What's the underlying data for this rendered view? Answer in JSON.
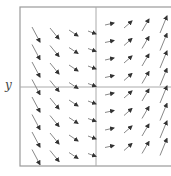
{
  "chart_data": {
    "type": "quiver",
    "title": "",
    "xlabel": "",
    "ylabel": "y",
    "grid": false,
    "legend": null,
    "frame": {
      "left": 20,
      "top": 7,
      "right": 175,
      "bottom": 166,
      "color": "#9a9a9a"
    },
    "axes_lines": {
      "vertical_x": 96,
      "horizontal_y": 87,
      "color": "#aaaaaa"
    },
    "arrow_color": "#7a7a7a",
    "arrowhead_color": "#333333",
    "rows": 8,
    "row_spacing": 17.5,
    "columns": [
      {
        "x1": 32,
        "dx": 8,
        "dy": 15,
        "y_start": 27
      },
      {
        "x1": 50,
        "dx": 9,
        "dy": 11,
        "y_start": 28
      },
      {
        "x1": 69,
        "dx": 9,
        "dy": 6,
        "y_start": 30
      },
      {
        "x1": 88,
        "dx": 8,
        "dy": 3,
        "y_start": 31
      },
      {
        "x1": 105,
        "dx": 9,
        "dy": -2,
        "y_start": 25
      },
      {
        "x1": 124,
        "dx": 8,
        "dy": -7,
        "y_start": 28
      },
      {
        "x1": 142,
        "dx": 7,
        "dy": -12,
        "y_start": 31
      },
      {
        "x1": 160,
        "dx": 7,
        "dy": -17,
        "y_start": 33
      }
    ]
  }
}
